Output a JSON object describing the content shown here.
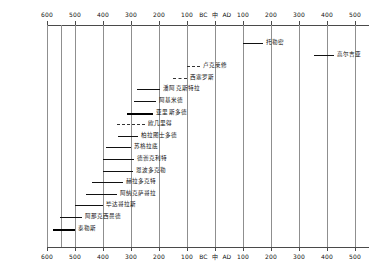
{
  "chart_data": {
    "type": "bar",
    "orientation": "horizontal",
    "title": "",
    "subtitle": "",
    "xlabel": "",
    "ylabel": "",
    "grid": true,
    "legend": "none",
    "axis": {
      "era_left": "BC",
      "era_right": "AD",
      "era_divider": "中",
      "xlim": [
        -600,
        550
      ],
      "top_ticks": [
        {
          "label": "600",
          "value": -600
        },
        {
          "label": "500",
          "value": -500
        },
        {
          "label": "400",
          "value": -400
        },
        {
          "label": "300",
          "value": -300
        },
        {
          "label": "200",
          "value": -200
        },
        {
          "label": "100",
          "value": -100
        },
        {
          "label": "100",
          "value": 100
        },
        {
          "label": "200",
          "value": 200
        },
        {
          "label": "300",
          "value": 300
        },
        {
          "label": "400",
          "value": 400
        },
        {
          "label": "500",
          "value": 500
        }
      ],
      "bottom_ticks": [
        {
          "label": "600",
          "value": -600
        },
        {
          "label": "500",
          "value": -500
        },
        {
          "label": "400",
          "value": -400
        },
        {
          "label": "300",
          "value": -300
        },
        {
          "label": "200",
          "value": -200
        },
        {
          "label": "100",
          "value": -100
        },
        {
          "label": "100",
          "value": 100
        },
        {
          "label": "200",
          "value": 200
        },
        {
          "label": "300",
          "value": 300
        },
        {
          "label": "400",
          "value": 400
        },
        {
          "label": "500",
          "value": 500
        }
      ],
      "gridlines": [
        -600,
        -550,
        -500,
        -400,
        -300,
        -200,
        -100,
        0,
        100,
        200,
        300,
        400,
        500
      ]
    },
    "categories": [
      "普罗克洛斯",
      "高尔吉亚",
      "潘托克利特",
      "伪罗吉芬",
      "亵安西迪斯",
      "李锡乌斯",
      "苏格拉底",
      "德谫克利特",
      "适波克拉底",
      "恩波多克勒",
      "艾罗斯多德",
      "欧几里得",
      "阿基米德",
      "阿波罗尼乌斯",
      "潘蒂迪乌斯",
      "西塞罗",
      "鲁克莱修",
      "维特鲁伍",
      "托勒密"
    ],
    "bars": [
      {
        "name": "托勒密",
        "start": 100,
        "end": 170,
        "style": "solid",
        "caps": false,
        "label": "托勒密",
        "row": 0
      },
      {
        "name": "弗朗托纳斯",
        "start": 355,
        "end": 425,
        "style": "solid",
        "caps": false,
        "label": "高尔吉亚",
        "row": 1
      },
      {
        "name": "路克莱修",
        "start": -99,
        "end": -55,
        "style": "dashed",
        "caps": false,
        "label": "卢克莱修",
        "row": 2
      },
      {
        "name": "西塞罗",
        "start": -150,
        "end": -100,
        "style": "dashed",
        "caps": false,
        "label": "西塞罗斯",
        "row": 3
      },
      {
        "name": "潘蒂迪乌斯",
        "start": -280,
        "end": -195,
        "style": "solid",
        "caps": false,
        "label": "潘阿克斯特拉",
        "row": 4
      },
      {
        "name": "阿基米德",
        "start": -290,
        "end": -212,
        "style": "solid",
        "caps": false,
        "label": "阿基米德",
        "row": 5
      },
      {
        "name": "阿里斯托克利",
        "start": -315,
        "end": -220,
        "style": "thick",
        "caps": false,
        "label": "亚里斯多德",
        "row": 6
      },
      {
        "name": "欧几里得",
        "start": -350,
        "end": -250,
        "style": "dashed",
        "caps": false,
        "label": "欧几里得",
        "row": 7
      },
      {
        "name": "柏拉图",
        "start": -347,
        "end": -275,
        "style": "solid",
        "caps": false,
        "label": "柏拉图士多德",
        "row": 8
      },
      {
        "name": "苏格拉底",
        "start": -390,
        "end": -300,
        "style": "solid",
        "caps": false,
        "label": "苏格拉底",
        "row": 9
      },
      {
        "name": "德谫克利特",
        "start": -400,
        "end": -290,
        "style": "solid",
        "caps": false,
        "label": "德谫克利特",
        "row": 10
      },
      {
        "name": "恩波多克勒",
        "start": -400,
        "end": -293,
        "style": "solid",
        "caps": false,
        "label": "恩波多克勒",
        "row": 11
      },
      {
        "name": "赫拉克利特",
        "start": -440,
        "end": -330,
        "style": "solid",
        "caps": false,
        "label": "赫拉多克特",
        "row": 12
      },
      {
        "name": "阿纳克西梅尼",
        "start": -460,
        "end": -350,
        "style": "solid",
        "caps": false,
        "label": "阿纳克萨哥拉",
        "row": 13
      },
      {
        "name": "毕达哥拉斯",
        "start": -500,
        "end": -400,
        "style": "solid",
        "caps": false,
        "label": "毕达哥拉斯",
        "row": 14
      },
      {
        "name": "阿那克西曼德",
        "start": -552,
        "end": -475,
        "style": "solid",
        "caps": false,
        "label": "阿那克西曼德",
        "row": 15
      },
      {
        "name": "泰勒斯",
        "start": -580,
        "end": -500,
        "style": "thick",
        "caps": false,
        "label": "泰勒斯",
        "row": 16
      }
    ],
    "annotations": []
  }
}
